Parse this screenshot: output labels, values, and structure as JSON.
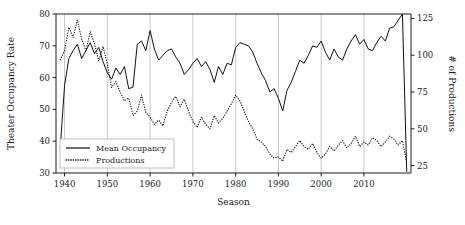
{
  "chart_data": {
    "type": "line",
    "title": "",
    "xlabel": "Season",
    "ylabel": "Theater Occupancy Rate",
    "y2label": "# of Productions",
    "grid": "vertical",
    "legend_position": "lower-left",
    "xlim": [
      1938,
      2021
    ],
    "ylim": [
      30,
      80
    ],
    "y2lim": [
      20,
      128
    ],
    "xticks": [
      1940,
      1950,
      1960,
      1970,
      1980,
      1990,
      2000,
      2010
    ],
    "xtick_labels": [
      "1940",
      "1950",
      "1960",
      "1970",
      "1980",
      "1990",
      "2000",
      "2010"
    ],
    "yticks": [
      30,
      40,
      50,
      60,
      70,
      80
    ],
    "ytick_labels": [
      "30",
      "40",
      "50",
      "60",
      "70",
      "80"
    ],
    "y2ticks": [
      25,
      50,
      75,
      100,
      125
    ],
    "y2tick_labels": [
      "25",
      "50",
      "75",
      "100",
      "125"
    ],
    "x": [
      1939,
      1940,
      1941,
      1942,
      1943,
      1944,
      1945,
      1946,
      1947,
      1948,
      1949,
      1950,
      1951,
      1952,
      1953,
      1954,
      1955,
      1956,
      1957,
      1958,
      1959,
      1960,
      1961,
      1962,
      1963,
      1964,
      1965,
      1966,
      1967,
      1968,
      1969,
      1970,
      1971,
      1972,
      1973,
      1974,
      1975,
      1976,
      1977,
      1978,
      1979,
      1980,
      1981,
      1982,
      1983,
      1984,
      1985,
      1986,
      1987,
      1988,
      1989,
      1990,
      1991,
      1992,
      1993,
      1994,
      1995,
      1996,
      1997,
      1998,
      1999,
      2000,
      2001,
      2002,
      2003,
      2004,
      2005,
      2006,
      2007,
      2008,
      2009,
      2010,
      2011,
      2012,
      2013,
      2014,
      2015,
      2016,
      2017,
      2018,
      2019,
      2020
    ],
    "series": [
      {
        "name": "Mean Occupancy",
        "axis": "left",
        "style": "solid",
        "values": [
          38.0,
          57.5,
          66.0,
          68.5,
          70.5,
          66.0,
          68.5,
          71.0,
          67.5,
          69.5,
          65.0,
          61.5,
          59.5,
          63.0,
          61.0,
          63.5,
          56.5,
          57.0,
          70.5,
          71.5,
          68.5,
          74.8,
          69.0,
          65.5,
          67.0,
          68.5,
          69.0,
          66.5,
          64.5,
          61.0,
          62.5,
          64.5,
          66.0,
          63.5,
          65.0,
          62.5,
          58.5,
          63.5,
          61.0,
          64.5,
          64.0,
          69.5,
          71.0,
          70.5,
          70.0,
          68.0,
          64.5,
          61.5,
          59.0,
          55.5,
          56.5,
          53.5,
          49.5,
          56.0,
          58.5,
          62.0,
          65.5,
          64.5,
          67.0,
          70.0,
          69.5,
          71.5,
          68.0,
          65.5,
          69.0,
          66.5,
          65.5,
          69.0,
          71.5,
          73.5,
          70.5,
          72.0,
          69.0,
          68.5,
          71.0,
          73.0,
          71.5,
          75.5,
          76.0,
          78.0,
          80.0,
          30.5
        ]
      },
      {
        "name": "Productions",
        "axis": "right",
        "style": "dotted",
        "values": [
          97,
          103,
          119,
          112,
          124,
          111,
          103,
          116,
          108,
          96,
          106,
          94,
          78,
          82,
          75,
          69,
          71,
          59,
          62,
          73,
          61,
          58,
          53,
          56,
          52,
          62,
          68,
          72,
          65,
          70,
          62,
          55,
          51,
          58,
          53,
          50,
          59,
          54,
          57,
          62,
          67,
          73,
          69,
          62,
          55,
          50,
          43,
          41,
          38,
          33,
          30,
          31,
          28,
          36,
          34,
          38,
          42,
          38,
          36,
          40,
          34,
          30,
          33,
          38,
          35,
          39,
          42,
          37,
          40,
          45,
          38,
          41,
          39,
          44,
          42,
          38,
          41,
          45,
          43,
          39,
          42,
          27
        ]
      }
    ]
  },
  "legend": {
    "entries": [
      {
        "label": "Mean Occupancy",
        "style": "solid"
      },
      {
        "label": "Productions",
        "style": "dotted"
      }
    ]
  }
}
